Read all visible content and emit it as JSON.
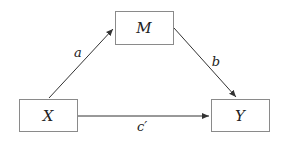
{
  "diagram": {
    "type": "mediation-path-diagram",
    "nodes": [
      {
        "id": "M",
        "label": "M",
        "x": 115,
        "y": 11,
        "w": 58,
        "h": 34
      },
      {
        "id": "X",
        "label": "X",
        "x": 19,
        "y": 99,
        "w": 59,
        "h": 33
      },
      {
        "id": "Y",
        "label": "Y",
        "x": 211,
        "y": 99,
        "w": 59,
        "h": 33
      }
    ],
    "edges": [
      {
        "id": "a",
        "from": "X",
        "to": "M",
        "label": "a"
      },
      {
        "id": "b",
        "from": "M",
        "to": "Y",
        "label": "b"
      },
      {
        "id": "c_prime",
        "from": "X",
        "to": "Y",
        "label": "c′"
      }
    ],
    "colors": {
      "stroke": "#333333",
      "box_border": "#8a8a8a",
      "text": "#222222"
    }
  }
}
